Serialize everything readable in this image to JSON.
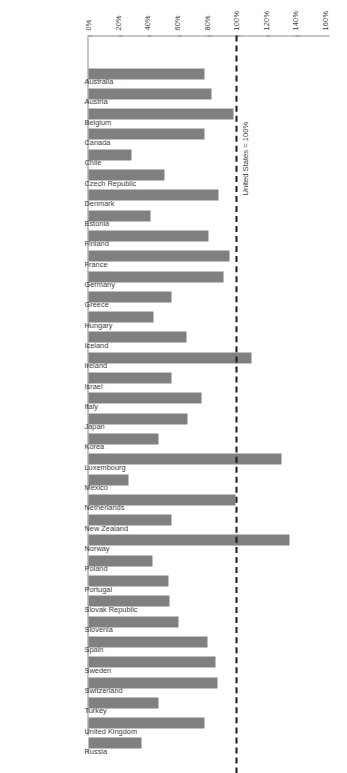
{
  "chart_data": {
    "type": "bar",
    "orientation": "horizontal",
    "title": "",
    "subtitle": "",
    "xlabel": "",
    "ylabel": "",
    "xlim": [
      0,
      160
    ],
    "grid": false,
    "legend": null,
    "tick_labels": [
      "0%",
      "20%",
      "40%",
      "60%",
      "80%",
      "100%",
      "120%",
      "140%",
      "160%"
    ],
    "tick_values": [
      0,
      20,
      40,
      60,
      80,
      100,
      120,
      140,
      160
    ],
    "annotations": [
      {
        "name": "reference-line",
        "text": "United States = 100%",
        "value": 100,
        "style": "dashed"
      }
    ],
    "categories": [
      "Australia",
      "Austria",
      "Belgium",
      "Canada",
      "Chile",
      "Czech Republic",
      "Denmark",
      "Estonia",
      "Finland",
      "France",
      "Germany",
      "Greece",
      "Hungary",
      "Iceland",
      "Ireland",
      "Israel",
      "Italy",
      "Japan",
      "Korea",
      "Luxembourg",
      "Mexico",
      "Netherlands",
      "New Zealand",
      "Norway",
      "Poland",
      "Portugal",
      "Slovak Republic",
      "Slovenia",
      "Spain",
      "Sweden",
      "Switzerland",
      "Turkey",
      "United Kingdom",
      "Russia"
    ],
    "values": [
      78,
      83,
      98,
      78,
      29,
      51,
      88,
      42,
      81,
      95,
      91,
      56,
      44,
      66,
      110,
      56,
      76,
      67,
      47,
      130,
      27,
      99,
      56,
      136,
      43,
      54,
      55,
      61,
      80,
      86,
      87,
      47,
      78,
      36
    ]
  },
  "style": {
    "bar_color": "#808080",
    "axis_color": "#8d8d8d",
    "text_color": "#3d3d3d",
    "refline_color": "#1a1a1a",
    "background": "#ffffff"
  }
}
